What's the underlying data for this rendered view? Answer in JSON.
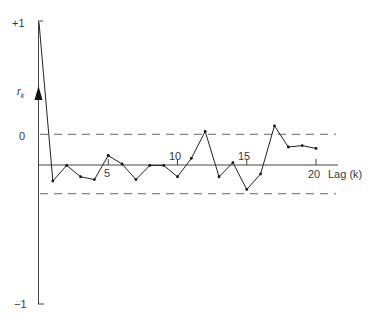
{
  "chart_data": {
    "type": "line",
    "title": "",
    "xlabel": "Lag (k)",
    "ylabel": "r_k",
    "x": [
      0,
      1,
      2,
      3,
      4,
      5,
      6,
      7,
      8,
      9,
      10,
      11,
      12,
      13,
      14,
      15,
      16,
      17,
      18,
      19,
      20
    ],
    "series": [
      {
        "name": "r_k",
        "values": [
          1.0,
          -0.12,
          -0.01,
          -0.09,
          -0.11,
          0.06,
          0.0,
          -0.11,
          -0.01,
          -0.01,
          -0.09,
          0.04,
          0.23,
          -0.09,
          0.01,
          -0.18,
          -0.07,
          0.27,
          0.12,
          0.13,
          0.11
        ]
      }
    ],
    "x_ticks": [
      5,
      10,
      15,
      20
    ],
    "y_tick_labels": [
      "+1",
      "0",
      "-1"
    ],
    "confidence_bounds": [
      0.21,
      -0.21
    ],
    "ylim": [
      -1,
      1
    ],
    "xlim": [
      0,
      21
    ],
    "grid": false,
    "legend": null
  },
  "labels": {
    "y_plus_one": "+1",
    "y_zero": "0",
    "y_minus_one": "−1",
    "y_axis_title": "r",
    "y_axis_subscript": "k",
    "x_axis_title": "Lag (k)",
    "tick_5": "5",
    "tick_10": "10",
    "tick_15": "15",
    "tick_20": "20"
  },
  "colors": {
    "ink": "#2b2b2b",
    "dash": "#555555",
    "background": "#ffffff"
  }
}
